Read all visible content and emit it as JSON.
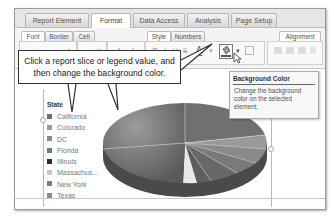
{
  "main_tabs": [
    {
      "label": "Report Element",
      "active": false
    },
    {
      "label": "Format",
      "active": true
    },
    {
      "label": "Data Access",
      "active": false
    },
    {
      "label": "Analysis",
      "active": false
    },
    {
      "label": "Page Setup",
      "active": false
    }
  ],
  "sub_tabs": {
    "font": "Font",
    "border": "Border",
    "cell": "Cell",
    "style": "Style",
    "numbers": "Numbers",
    "alignment": "Alignment"
  },
  "toolbar": {
    "bold": "B",
    "italic": "I",
    "underline": "U",
    "strike": "S",
    "font_color": "A",
    "grow_font": "A",
    "shrink_font": "A"
  },
  "callout": {
    "text_line1": "Click a report slice or legend value, and",
    "text_line2": "then change the background color."
  },
  "tooltip": {
    "title": "Background Color",
    "body": "Change the background color on the selected element."
  },
  "legend": {
    "title": "State",
    "items": [
      {
        "label": "California",
        "color": "#6e6e6e"
      },
      {
        "label": "Colorado",
        "color": "#9a9a9a"
      },
      {
        "label": "DC",
        "color": "#8a8a8a"
      },
      {
        "label": "Florida",
        "color": "#7a7a7a"
      },
      {
        "label": "Illinois",
        "color": "#2e2e2e"
      },
      {
        "label": "Massachus...",
        "color": "#c8c8c8"
      },
      {
        "label": "New York",
        "color": "#7c7c7c"
      },
      {
        "label": "Texas",
        "color": "#8c8c8c"
      }
    ]
  }
}
